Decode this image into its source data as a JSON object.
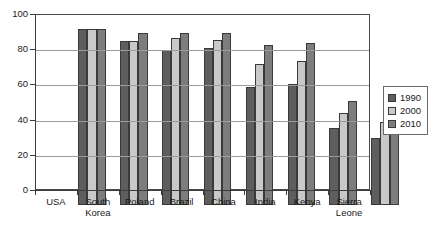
{
  "chart_data": {
    "type": "bar",
    "title": "",
    "xlabel": "",
    "ylabel": "",
    "ylim": [
      0,
      100
    ],
    "yticks": [
      0,
      20,
      40,
      60,
      80,
      100
    ],
    "grid": true,
    "legend_position": "right",
    "categories": [
      "USA",
      "South\nKorea",
      "Poland",
      "Brazil",
      "China",
      "India",
      "Kenya",
      "Sierra\nLeone"
    ],
    "series": [
      {
        "name": "1990",
        "color": "#5e5e5e",
        "values": [
          100,
          93,
          88,
          89,
          67,
          69,
          44,
          38
        ]
      },
      {
        "name": "2000",
        "color": "#c9c9c9",
        "values": [
          100,
          93,
          95,
          94,
          80,
          82,
          52,
          47
        ]
      },
      {
        "name": "2010",
        "color": "#7d7d7d",
        "values": [
          100,
          98,
          98,
          98,
          91,
          92,
          59,
          54
        ]
      }
    ]
  },
  "legend": {
    "entries": [
      {
        "label": "1990",
        "swatch": "legend-swatch-1990"
      },
      {
        "label": "2000",
        "swatch": "legend-swatch-2000"
      },
      {
        "label": "2010",
        "swatch": "legend-swatch-2010"
      }
    ]
  },
  "caption": {
    "text": ""
  }
}
